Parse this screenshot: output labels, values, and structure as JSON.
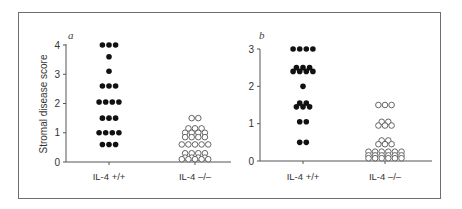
{
  "figure": {
    "frame_border_color": "#6e6e6e",
    "filled_color": "#111111",
    "open_color": "#555555"
  },
  "chart_data": [
    {
      "type": "scatter",
      "panel": "a",
      "title": "",
      "xlabel": "",
      "ylabel": "Stromal disease score",
      "ylim": [
        0,
        4
      ],
      "yticks": [
        0,
        1,
        2,
        3,
        4
      ],
      "categories": [
        "IL-4 +/+",
        "IL-4 –/–"
      ],
      "series": [
        {
          "name": "IL-4 +/+",
          "marker": "filled-circle",
          "values": [
            4,
            4,
            4,
            3.6,
            3.1,
            2.6,
            2.6,
            2.6,
            2.05,
            2.05,
            2.05,
            2.05,
            1.5,
            1.5,
            1.5,
            1.0,
            1.0,
            1.0,
            1.0,
            0.6,
            0.6,
            0.6
          ]
        },
        {
          "name": "IL-4 –/–",
          "marker": "open-circle",
          "values": [
            1.5,
            1.5,
            1.15,
            1.15,
            1.15,
            1.0,
            1.0,
            1.0,
            1.0,
            0.85,
            0.85,
            0.85,
            0.85,
            0.6,
            0.6,
            0.6,
            0.6,
            0.6,
            0.3,
            0.3,
            0.3,
            0.3,
            0.15,
            0.15,
            0.15,
            0.15,
            0.05,
            0.05,
            0.05,
            0.05,
            0.05
          ]
        }
      ],
      "grid": false,
      "legend": null
    },
    {
      "type": "scatter",
      "panel": "b",
      "title": "",
      "xlabel": "",
      "ylabel": "",
      "ylim": [
        0,
        3
      ],
      "yticks": [
        0,
        1,
        2,
        3
      ],
      "categories": [
        "IL-4 +/+",
        "IL-4 –/–"
      ],
      "series": [
        {
          "name": "IL-4 +/+",
          "marker": "filled-circle",
          "values": [
            3.0,
            3.0,
            3.0,
            3.0,
            2.5,
            2.5,
            2.5,
            2.4,
            2.4,
            2.4,
            2.4,
            2.0,
            1.55,
            1.55,
            1.45,
            1.45,
            1.45,
            1.05,
            1.05,
            0.5,
            0.5
          ]
        },
        {
          "name": "IL-4 –/–",
          "marker": "open-circle",
          "values": [
            1.5,
            1.5,
            1.5,
            1.05,
            1.05,
            0.95,
            0.95,
            0.95,
            0.55,
            0.55,
            0.45,
            0.45,
            0.45,
            0.25,
            0.25,
            0.25,
            0.25,
            0.25,
            0.25,
            0.15,
            0.15,
            0.15,
            0.15,
            0.15,
            0.15,
            0.05,
            0.05,
            0.05,
            0.05,
            0.05,
            0.05
          ]
        }
      ],
      "grid": false,
      "legend": null
    }
  ],
  "panels": [
    {
      "letter": "a",
      "ylabel": "Stromal disease score",
      "yticks": [
        "0",
        "1",
        "2",
        "3",
        "4"
      ],
      "categories": [
        "IL-4 +/+",
        "IL-4 –/–"
      ]
    },
    {
      "letter": "b",
      "ylabel": "",
      "yticks": [
        "0",
        "1",
        "2",
        "3"
      ],
      "categories": [
        "IL-4 +/+",
        "IL-4 –/–"
      ]
    }
  ]
}
